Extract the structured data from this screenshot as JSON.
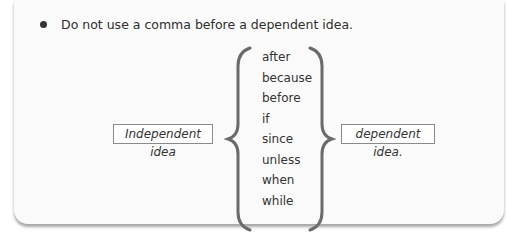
{
  "rule": {
    "bullet_icon": "bullet-icon",
    "text": "Do not use a comma before a dependent idea."
  },
  "diagram": {
    "left_box": "Independent idea",
    "right_box": "dependent idea.",
    "connectors": [
      "after",
      "because",
      "before",
      "if",
      "since",
      "unless",
      "when",
      "while"
    ]
  }
}
